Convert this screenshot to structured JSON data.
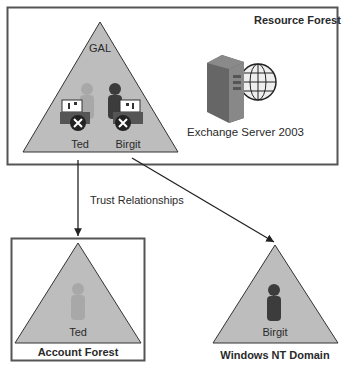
{
  "resource_forest": {
    "title": "Resource Forest",
    "gal_label": "GAL",
    "users": [
      {
        "name": "Ted",
        "icon": "light-user-icon",
        "mailbox": "disabled-mailbox-icon"
      },
      {
        "name": "Birgit",
        "icon": "dark-user-icon",
        "mailbox": "disabled-mailbox-icon"
      }
    ],
    "server": {
      "label": "Exchange Server 2003",
      "icon": "server-globe-icon"
    }
  },
  "connector": {
    "label": "Trust Relationships"
  },
  "account_forest": {
    "title": "Account Forest",
    "user": {
      "name": "Ted",
      "icon": "light-user-icon"
    }
  },
  "nt_domain": {
    "title": "Windows NT Domain",
    "user": {
      "name": "Birgit",
      "icon": "dark-user-icon"
    }
  },
  "colors": {
    "triangle_fill": "#bdbdbd",
    "border": "#555555",
    "light_user": "#a3a3a3",
    "dark_user": "#3c3c3c"
  }
}
